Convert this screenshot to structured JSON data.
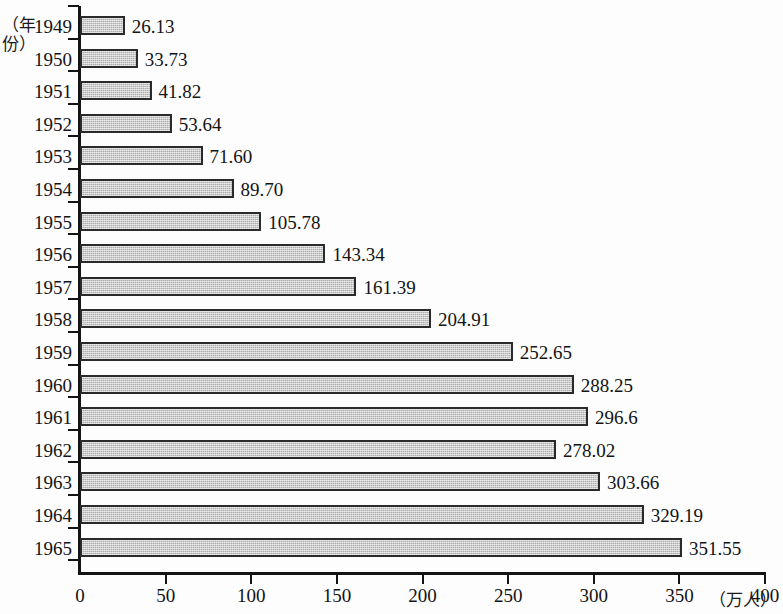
{
  "chart_data": {
    "type": "bar",
    "orientation": "horizontal",
    "title": "",
    "subtitle": "",
    "xlabel": "（万人）",
    "ylabel": "（年份）",
    "xlim": [
      0,
      400
    ],
    "ylim_categories": 17,
    "grid": false,
    "legend": null,
    "xticks": [
      0,
      50,
      100,
      150,
      200,
      250,
      300,
      350,
      400
    ],
    "xtick_labels": [
      "0",
      "50",
      "100",
      "150",
      "200",
      "250",
      "300",
      "350",
      "400"
    ],
    "categories": [
      "1949",
      "1950",
      "1951",
      "1952",
      "1953",
      "1954",
      "1955",
      "1956",
      "1957",
      "1958",
      "1959",
      "1960",
      "1961",
      "1962",
      "1963",
      "1964",
      "1965"
    ],
    "values": [
      26.13,
      33.73,
      41.82,
      53.64,
      71.6,
      89.7,
      105.78,
      143.34,
      161.39,
      204.91,
      252.65,
      288.25,
      296.6,
      278.02,
      303.66,
      329.19,
      351.55
    ],
    "data_labels": [
      "26.13",
      "33.73",
      "41.82",
      "53.64",
      "71.60",
      "89.70",
      "105.78",
      "143.34",
      "161.39",
      "204.91",
      "252.65",
      "288.25",
      "296.6",
      "278.02",
      "303.66",
      "329.19",
      "351.55"
    ],
    "bar_fill_color": "#bdbdbd",
    "bar_edge_color": "#2a2a2a",
    "axis_color": "#141414",
    "background_color": "#fdfdfd"
  }
}
